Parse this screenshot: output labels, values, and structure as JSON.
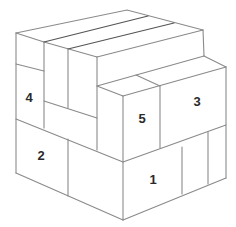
{
  "diagram": {
    "labels": [
      {
        "id": "1",
        "text": "1",
        "x": 153,
        "y": 181
      },
      {
        "id": "2",
        "text": "2",
        "x": 41,
        "y": 157
      },
      {
        "id": "3",
        "text": "3",
        "x": 197,
        "y": 103
      },
      {
        "id": "4",
        "text": "4",
        "x": 29,
        "y": 99
      },
      {
        "id": "5",
        "text": "5",
        "x": 142,
        "y": 120
      }
    ]
  }
}
